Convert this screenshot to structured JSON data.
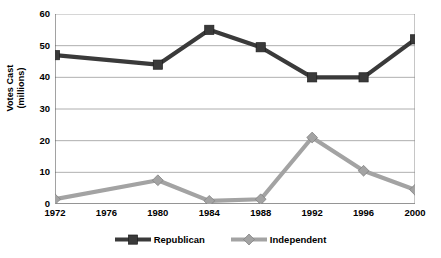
{
  "chart_data": {
    "type": "line",
    "title": "",
    "xlabel": "",
    "ylabel": "Votes Cast (millions)",
    "ylabel_line1": "Votes Cast",
    "ylabel_line2": "(millions)",
    "categories": [
      "1972",
      "1976",
      "1980",
      "1984",
      "1988",
      "1992",
      "1996",
      "2000"
    ],
    "x_tick_labels": [
      "1972",
      "1976",
      "1980",
      "1984",
      "1988",
      "1992",
      "1996",
      "2000"
    ],
    "y_tick_labels": [
      "0",
      "10",
      "20",
      "30",
      "40",
      "50",
      "60"
    ],
    "y_ticks": [
      0,
      10,
      20,
      30,
      40,
      50,
      60
    ],
    "ylim": [
      0,
      60
    ],
    "grid": "horizontal",
    "legend_position": "bottom",
    "series": [
      {
        "name": "Republican",
        "color": "#3a3a3a",
        "marker": "square",
        "values": [
          47,
          null,
          44,
          55,
          49.5,
          40,
          40,
          52
        ]
      },
      {
        "name": "Independent",
        "color": "#a3a3a3",
        "marker": "diamond",
        "values": [
          1.5,
          null,
          7.5,
          1,
          1.5,
          21,
          10.5,
          4.5
        ]
      }
    ]
  },
  "legend": {
    "entries": [
      {
        "label": "Republican",
        "color": "#3a3a3a",
        "marker": "square"
      },
      {
        "label": "Independent",
        "color": "#a3a3a3",
        "marker": "diamond"
      }
    ]
  },
  "axes": {
    "y_title_line1": "Votes Cast",
    "y_title_line2": "(millions)"
  }
}
